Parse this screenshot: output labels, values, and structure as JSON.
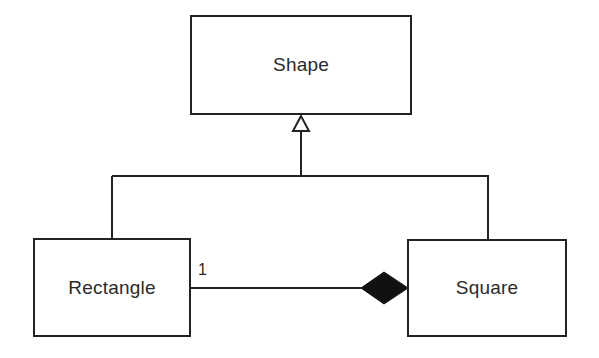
{
  "diagram": {
    "type": "UML class diagram",
    "colors": {
      "line": "#222222",
      "text": "#2a2a2a",
      "background": "#ffffff",
      "diamond_fill": "#111111"
    },
    "classes": [
      {
        "id": "shape",
        "name": "Shape"
      },
      {
        "id": "rectangle",
        "name": "Rectangle"
      },
      {
        "id": "square",
        "name": "Square"
      }
    ],
    "relationships": [
      {
        "type": "generalization",
        "from": "Rectangle",
        "to": "Shape",
        "marker": "hollow-triangle"
      },
      {
        "type": "generalization",
        "from": "Square",
        "to": "Shape",
        "marker": "hollow-triangle"
      },
      {
        "type": "composition",
        "whole": "Square",
        "part": "Rectangle",
        "marker": "filled-diamond",
        "multiplicity_at_part": "1"
      }
    ],
    "labels": {
      "composition_multiplicity": "1"
    }
  }
}
